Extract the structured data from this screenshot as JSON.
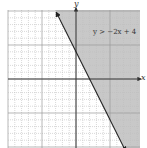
{
  "chart_data": {
    "type": "line",
    "title": "",
    "xlabel": "x",
    "ylabel": "y",
    "xlim": [
      -10,
      9
    ],
    "ylim": [
      -10,
      10
    ],
    "grid": true,
    "grid_style": "dotted minor, solid every 5 units",
    "series": [
      {
        "name": "boundary y = -2x + 4",
        "style": "solid with arrowheads",
        "x": [
          -2.9,
          7.3
        ],
        "y": [
          9.8,
          -10.6
        ]
      }
    ],
    "shaded_region": {
      "inequality": "y > -2x + 4",
      "side": "above/right of line",
      "color": "#c8c8c8"
    },
    "annotations": [
      {
        "text": "y > −2x + 4",
        "x": 6,
        "y": 7
      }
    ]
  },
  "labels": {
    "x_axis": "x",
    "y_axis": "y",
    "inequality": "y > −2x + 4"
  },
  "colors": {
    "shade": "#c8c8c8",
    "grid_minor": "#bdbdbd",
    "grid_major": "#9a9a9a",
    "axis": "#333333",
    "line": "#222222"
  }
}
